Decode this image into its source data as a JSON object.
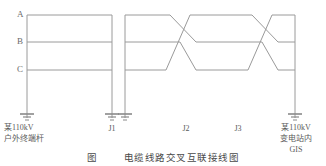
{
  "figure": {
    "type": "electrical-single-line-diagram",
    "phases": [
      {
        "id": "A",
        "label": "A",
        "y": 15
      },
      {
        "id": "B",
        "label": "B",
        "y": 42
      },
      {
        "id": "C",
        "label": "C",
        "y": 70
      }
    ],
    "poles": [
      {
        "id": "pole-start",
        "x": 27,
        "label_lines": [
          "某110kV",
          "户外终端杆"
        ],
        "grounded": true
      },
      {
        "id": "pole-j1-left",
        "x": 112,
        "label_lines": [
          "J1"
        ],
        "grounded": true
      },
      {
        "id": "pole-j1-right",
        "x": 125,
        "label_lines": [],
        "grounded": true
      },
      {
        "id": "pole-j2",
        "x": 208,
        "label_lines": [
          "J2"
        ],
        "grounded": false
      },
      {
        "id": "pole-j3",
        "x": 252,
        "label_lines": [
          "J3"
        ],
        "grounded": false
      },
      {
        "id": "pole-end",
        "x": 295,
        "label_lines": [
          "某110kV",
          "变电站内",
          "GIS"
        ],
        "grounded": true
      }
    ],
    "joint_labels": [
      {
        "id": "J1",
        "text": "J1",
        "x": 112,
        "y": 122
      },
      {
        "id": "J2",
        "text": "J2",
        "x": 186,
        "y": 122
      },
      {
        "id": "J3",
        "text": "J3",
        "x": 238,
        "y": 122
      }
    ],
    "terminal_labels": [
      {
        "id": "left-terminal",
        "lines": [
          "某110kV",
          "户外终端杆"
        ],
        "x": 34,
        "y": 121
      },
      {
        "id": "right-terminal",
        "lines": [
          "某110kV",
          "变电站内",
          "GIS"
        ],
        "x": 295,
        "y": 121
      }
    ],
    "sections": [
      {
        "id": "section-1",
        "from_x": 27,
        "to_x": 112,
        "crossed": false
      },
      {
        "id": "section-2",
        "from_x": 125,
        "to_x": 208,
        "crossed": true
      },
      {
        "id": "section-3",
        "from_x": 208,
        "to_x": 295,
        "crossed": true
      }
    ],
    "ground_y": 118,
    "pole_top_y": 15,
    "pole_bottom_y": 118,
    "line_color": "#9a9a9a",
    "text_color": "#5a5a5a"
  },
  "caption": {
    "prefix": "图",
    "number": "",
    "text": "电缆线路交叉互联接线图"
  }
}
